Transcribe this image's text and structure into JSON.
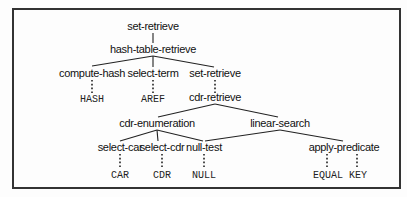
{
  "diagram": {
    "type": "tree",
    "nodes": {
      "root": {
        "label": "set-retrieve",
        "x": 153,
        "y": 30
      },
      "hash_table_retrieve": {
        "label": "hash-table-retrieve",
        "x": 153,
        "y": 53
      },
      "compute_hash": {
        "label": "compute-hash",
        "x": 92,
        "y": 77
      },
      "select_term": {
        "label": "select-term",
        "x": 153,
        "y": 77
      },
      "set_retrieve_2": {
        "label": "set-retrieve",
        "x": 215,
        "y": 77
      },
      "hash": {
        "label": "HASH",
        "x": 92,
        "y": 101
      },
      "aref": {
        "label": "AREF",
        "x": 153,
        "y": 101
      },
      "cdr_retrieve": {
        "label": "cdr-retrieve",
        "x": 215,
        "y": 101
      },
      "cdr_enumeration": {
        "label": "cdr-enumeration",
        "x": 157,
        "y": 127
      },
      "linear_search": {
        "label": "linear-search",
        "x": 280,
        "y": 127
      },
      "select_car": {
        "label": "select-car",
        "x": 120,
        "y": 151
      },
      "select_cdr": {
        "label": "select-cdr",
        "x": 162,
        "y": 151
      },
      "null_test": {
        "label": "null-test",
        "x": 204,
        "y": 151
      },
      "apply_predicate": {
        "label": "apply-predicate",
        "x": 345,
        "y": 151
      },
      "car": {
        "label": "CAR",
        "x": 120,
        "y": 177
      },
      "cdr": {
        "label": "CDR",
        "x": 162,
        "y": 177
      },
      "null": {
        "label": "NULL",
        "x": 204,
        "y": 177
      },
      "equal": {
        "label": "EQUAL",
        "x": 330,
        "y": 177
      },
      "key": {
        "label": "KEY",
        "x": 358,
        "y": 177
      }
    },
    "solid_edges": [
      [
        "root",
        "hash_table_retrieve"
      ],
      [
        "hash_table_retrieve",
        "compute_hash"
      ],
      [
        "hash_table_retrieve",
        "select_term"
      ],
      [
        "hash_table_retrieve",
        "set_retrieve_2"
      ],
      [
        "cdr_retrieve",
        "cdr_enumeration"
      ],
      [
        "cdr_retrieve",
        "linear_search"
      ],
      [
        "cdr_enumeration",
        "select_car"
      ],
      [
        "cdr_enumeration",
        "select_cdr"
      ],
      [
        "cdr_enumeration",
        "null_test"
      ],
      [
        "linear_search",
        "null_test"
      ],
      [
        "linear_search",
        "apply_predicate"
      ]
    ],
    "dotted_edges": [
      [
        "compute_hash",
        "hash"
      ],
      [
        "select_term",
        "aref"
      ],
      [
        "set_retrieve_2",
        "cdr_retrieve"
      ],
      [
        "select_car",
        "car"
      ],
      [
        "select_cdr",
        "cdr"
      ],
      [
        "null_test",
        "null"
      ],
      [
        "apply_predicate",
        "equal"
      ],
      [
        "apply_predicate",
        "key"
      ]
    ]
  }
}
